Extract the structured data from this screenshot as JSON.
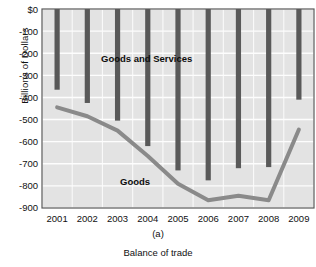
{
  "chart_data": {
    "type": "bar",
    "title": "",
    "subtitle": "",
    "xlabel": "Balance of trade",
    "ylabel": "Billions of Dollars",
    "categories": [
      "2001",
      "2002",
      "2003",
      "2004",
      "2005",
      "2006",
      "2007",
      "2008",
      "2009"
    ],
    "ylim": [
      -900,
      0
    ],
    "ytick_values": [
      0,
      -100,
      -200,
      -300,
      -400,
      -500,
      -600,
      -700,
      -800,
      -900
    ],
    "ytick_labels": [
      "$0",
      "-100",
      "-200",
      "-300",
      "-400",
      "-500",
      "-600",
      "-700",
      "-800",
      "-900"
    ],
    "grid": true,
    "legend_position": "inline-annotations",
    "series": [
      {
        "name": "Goods and Services",
        "render": "bar",
        "color": "#595959",
        "values": [
          -365,
          -425,
          -505,
          -620,
          -730,
          -775,
          -720,
          -715,
          -410
        ]
      },
      {
        "name": "Goods",
        "render": "line",
        "color": "#8a8a8a",
        "values": [
          -445,
          -485,
          -550,
          -665,
          -790,
          -865,
          -845,
          -865,
          -545
        ]
      }
    ],
    "annotations": [
      {
        "text": "Goods and Services",
        "series": "Goods and Services"
      },
      {
        "text": "Goods",
        "series": "Goods"
      }
    ],
    "figure_label": "(a)",
    "colors": {
      "plot_background": "#e3e3e3",
      "gridline": "#fdfdfd",
      "axis": "#5a5a5a",
      "bar": "#595959",
      "line": "#8a8a8a",
      "text": "#111111"
    }
  },
  "axis": {
    "y_title": "Billions of Dollars",
    "ticks_y": [
      "$0",
      "-100",
      "-200",
      "-300",
      "-400",
      "-500",
      "-600",
      "-700",
      "-800",
      "-900"
    ],
    "ticks_x": [
      "2001",
      "2002",
      "2003",
      "2004",
      "2005",
      "2006",
      "2007",
      "2008",
      "2009"
    ]
  },
  "annotations": {
    "goods_and_services": "Goods and Services",
    "goods": "Goods"
  },
  "caption": {
    "figure_label": "(a)",
    "title": "Balance of trade"
  }
}
